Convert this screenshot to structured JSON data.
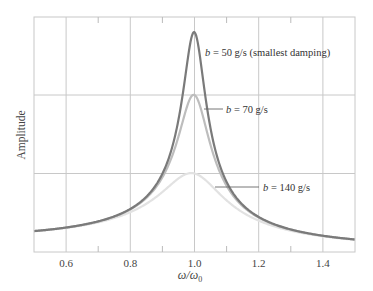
{
  "chart_data": {
    "type": "line",
    "title": "",
    "xlabel": "ω/ω0",
    "xlabel_main": "ω/ω",
    "xlabel_sub": "0",
    "ylabel": "Amplitude",
    "xlim": [
      0.5,
      1.5
    ],
    "xticks": [
      0.6,
      0.8,
      1.0,
      1.2,
      1.4
    ],
    "xtick_labels": [
      "0.6",
      "0.8",
      "1.0",
      "1.2",
      "1.4"
    ],
    "minor_xticks": [
      0.7,
      0.9,
      1.1,
      1.3
    ],
    "ygrid_levels_relative": [
      0.5,
      1.0
    ],
    "yticks_labeled": false,
    "grid": true,
    "legend_position": "inline annotations",
    "series": [
      {
        "name": "b = 50 g/s (smallest damping)",
        "damping_b": 50,
        "unit": "g/s",
        "relative_peak_amplitude": 1.4,
        "peak_x": 1.0,
        "color": "#7a7a7a",
        "stroke_width": 2.2
      },
      {
        "name": "b = 70 g/s",
        "damping_b": 70,
        "unit": "g/s",
        "relative_peak_amplitude": 1.0,
        "peak_x": 1.0,
        "color": "#bdbdbd",
        "stroke_width": 2.2
      },
      {
        "name": "b = 140 g/s",
        "damping_b": 140,
        "unit": "g/s",
        "relative_peak_amplitude": 0.5,
        "peak_x": 1.0,
        "color": "#e2e2e2",
        "stroke_width": 2.2
      }
    ],
    "annotations": [
      {
        "var": "b",
        "text": " = 50 g/s (smallest damping)",
        "series": 0
      },
      {
        "var": "b",
        "text": " = 70 g/s",
        "series": 1
      },
      {
        "var": "b",
        "text": " = 140 g/s",
        "series": 2
      }
    ]
  },
  "colors": {
    "grid": "#c8c8c8",
    "frame": "#c8c8c8",
    "text": "#444444"
  }
}
